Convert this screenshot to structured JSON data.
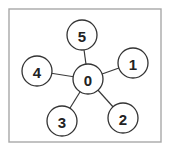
{
  "diagram": {
    "type": "star-graph",
    "frame": {
      "x": 9,
      "y": 9,
      "width": 152,
      "height": 133,
      "color": "#a8a8a8"
    },
    "node_radius": 15,
    "nodes": [
      {
        "id": "0",
        "label": "0",
        "x": 88,
        "y": 79
      },
      {
        "id": "1",
        "label": "1",
        "x": 133,
        "y": 63
      },
      {
        "id": "2",
        "label": "2",
        "x": 123,
        "y": 118
      },
      {
        "id": "3",
        "label": "3",
        "x": 62,
        "y": 121
      },
      {
        "id": "4",
        "label": "4",
        "x": 37,
        "y": 71
      },
      {
        "id": "5",
        "label": "5",
        "x": 82,
        "y": 35
      }
    ],
    "edges": [
      {
        "from": "0",
        "to": "1"
      },
      {
        "from": "0",
        "to": "2"
      },
      {
        "from": "0",
        "to": "3"
      },
      {
        "from": "0",
        "to": "4"
      },
      {
        "from": "0",
        "to": "5"
      }
    ],
    "colors": {
      "node_stroke": "#333333",
      "edge": "#3a3a3a",
      "label": "#222222",
      "background": "#ffffff"
    }
  }
}
